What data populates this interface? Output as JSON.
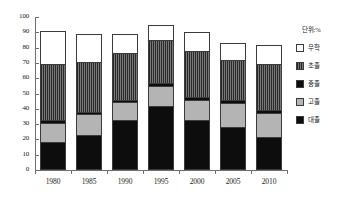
{
  "chart_data": {
    "type": "bar",
    "stacked": true,
    "title": "",
    "subtitle": "",
    "unit_note": "단위:%",
    "xlabel": "",
    "ylabel": "",
    "categories": [
      "1980",
      "1985",
      "1990",
      "1995",
      "2000",
      "2005",
      "2010"
    ],
    "ylim": [
      0,
      100
    ],
    "yticks": [
      0,
      10,
      20,
      30,
      40,
      50,
      60,
      70,
      80,
      90,
      100
    ],
    "ytick_labels": [
      "0",
      "10",
      "20",
      "30",
      "40",
      "50",
      "60",
      "70",
      "80",
      "90",
      "100"
    ],
    "grid": false,
    "legend_position": "right",
    "legend_title": "단위:%",
    "series": [
      {
        "name": "대졸",
        "swatch": "black",
        "color": "#0d0d0d",
        "values": [
          22.0,
          18.5,
          12.5,
          10.0,
          12.5,
          11.0,
          13.0
        ]
      },
      {
        "name": "고졸",
        "swatch": "light-gray",
        "color": "#b4b4b4",
        "values": [
          36.0,
          32.5,
          30.5,
          28.0,
          29.5,
          26.0,
          29.5
        ]
      },
      {
        "name": "중졸",
        "swatch": "black",
        "color": "#0d0d0d",
        "values": [
          2.0,
          1.5,
          1.5,
          2.0,
          2.0,
          2.0,
          2.5
        ]
      },
      {
        "name": "초졸",
        "swatch": "dark-hatch",
        "color": "#5b5b5b",
        "values": [
          13.0,
          13.5,
          11.5,
          13.0,
          13.5,
          16.0,
          15.5
        ]
      },
      {
        "name": "무학",
        "swatch": "white",
        "color": "#ffffff",
        "values": [
          18.0,
          23.0,
          33.0,
          42.0,
          32.5,
          28.0,
          21.5
        ]
      }
    ],
    "cumulative_tops": {
      "1980": [
        18.0,
        31.0,
        33.0,
        69.0,
        91.0
      ],
      "1985": [
        23.0,
        36.5,
        38.0,
        70.5,
        89.0
      ],
      "1990": [
        33.0,
        44.5,
        46.0,
        76.5,
        89.0
      ],
      "1995": [
        42.0,
        55.0,
        57.0,
        85.0,
        95.0
      ],
      "2000": [
        32.5,
        46.0,
        48.0,
        77.5,
        90.0
      ],
      "2005": [
        28.0,
        44.0,
        46.0,
        72.0,
        83.0
      ],
      "2010": [
        21.5,
        37.0,
        39.5,
        69.0,
        82.0
      ]
    },
    "totals": [
      91.0,
      89.0,
      89.0,
      95.0,
      90.0,
      83.0,
      82.0
    ]
  }
}
